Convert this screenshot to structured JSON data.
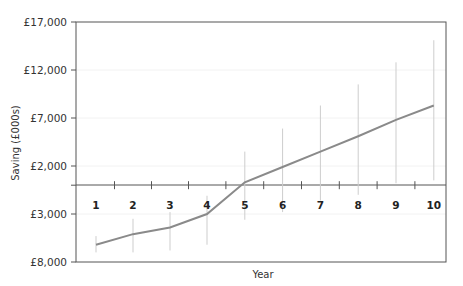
{
  "chart_data": {
    "type": "line",
    "title": "",
    "xlabel": "Year",
    "ylabel": "Saving (£000s)",
    "categories": [
      "1",
      "2",
      "3",
      "4",
      "5",
      "6",
      "7",
      "8",
      "9",
      "10"
    ],
    "series": [
      {
        "name": "Saving",
        "values": [
          -6200,
          -5100,
          -4400,
          -3000,
          300,
          1900,
          3500,
          5100,
          6800,
          8300
        ],
        "error_low": [
          -7000,
          -7000,
          -6800,
          -6200,
          -3600,
          -2800,
          -1600,
          -1000,
          200,
          500
        ],
        "error_high": [
          -5300,
          -3500,
          -2800,
          -1100,
          3500,
          5900,
          8300,
          10500,
          12800,
          15100
        ]
      }
    ],
    "y_ticks": [
      17000,
      12000,
      7000,
      2000,
      0,
      -3000,
      -8000
    ],
    "y_tick_labels": [
      "£17,000",
      "£12,000",
      "£7,000",
      "£2,000",
      "",
      "£3,000",
      "£8,000"
    ],
    "ylim": [
      -8000,
      17000
    ],
    "grid": true,
    "legend": "none",
    "colors": {
      "line": "#8a8a8a",
      "error_bar": "#cdcdcd",
      "axis": "#555555",
      "grid": "#f2f2f2"
    }
  }
}
